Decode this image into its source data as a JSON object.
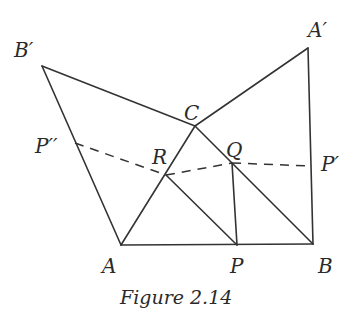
{
  "figure": {
    "caption": "Figure 2.14",
    "stroke_color": "#333333",
    "points": {
      "B_prime": {
        "label": "B′",
        "x": 42,
        "y": 66
      },
      "A_prime": {
        "label": "A′",
        "x": 308,
        "y": 48
      },
      "C": {
        "label": "C",
        "x": 195,
        "y": 126
      },
      "A": {
        "label": "A",
        "x": 121,
        "y": 245
      },
      "B": {
        "label": "B",
        "x": 313,
        "y": 244
      },
      "P": {
        "label": "P",
        "x": 237,
        "y": 245
      },
      "R": {
        "label": "R",
        "x": 166,
        "y": 175
      },
      "Q": {
        "label": "Q",
        "x": 232,
        "y": 163
      },
      "P_double_prime": {
        "label": "P′′",
        "x": 75,
        "y": 143
      },
      "P_prime": {
        "label": "P′",
        "x": 312,
        "y": 166
      }
    },
    "solid_segments": [
      [
        "B_prime",
        "C"
      ],
      [
        "C",
        "A_prime"
      ],
      [
        "A_prime",
        "B"
      ],
      [
        "A",
        "B"
      ],
      [
        "A",
        "C"
      ],
      [
        "C",
        "B"
      ],
      [
        "B_prime",
        "A"
      ],
      [
        "R",
        "P"
      ],
      [
        "Q",
        "P"
      ]
    ],
    "dashed_segments": [
      [
        "P_double_prime",
        "R"
      ],
      [
        "R",
        "Q"
      ],
      [
        "Q",
        "P_prime"
      ]
    ]
  }
}
